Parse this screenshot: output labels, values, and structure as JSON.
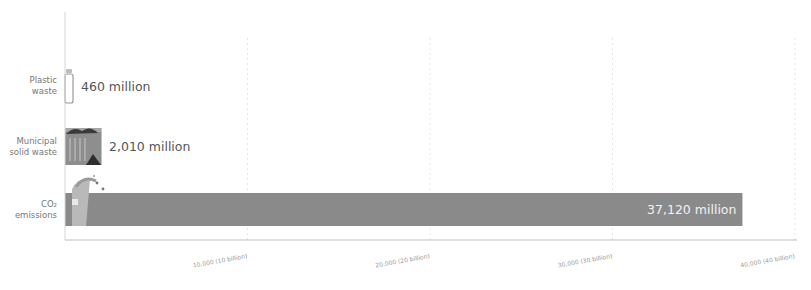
{
  "chart_data": {
    "type": "bar",
    "orientation": "horizontal",
    "title": "",
    "xlabel": "",
    "ylabel": "",
    "categories": [
      "Plastic waste",
      "Municipal solid waste",
      "CO2 emissions"
    ],
    "category_lines": [
      [
        "Plastic",
        "waste"
      ],
      [
        "Municipal",
        "solid waste"
      ],
      [
        "CO₂",
        "emissions"
      ]
    ],
    "values": [
      460,
      2010,
      37120
    ],
    "value_labels": [
      "460 million",
      "2,010 million",
      "37,120 million"
    ],
    "units": "million tonnes",
    "xlim": [
      0,
      40000
    ],
    "x_ticks": [
      10000,
      20000,
      30000,
      40000
    ],
    "x_tick_labels": [
      "10,000 (10 billion)",
      "20,000 (20 billion)",
      "30,000 (30 billion)",
      "40,000 (40 billion)"
    ],
    "grid": true,
    "legend": "none",
    "bar_color": "#8a8a8a",
    "icons": [
      "plastic-bottle-icon",
      "trash-bin-icon",
      "smokestack-icon"
    ]
  }
}
